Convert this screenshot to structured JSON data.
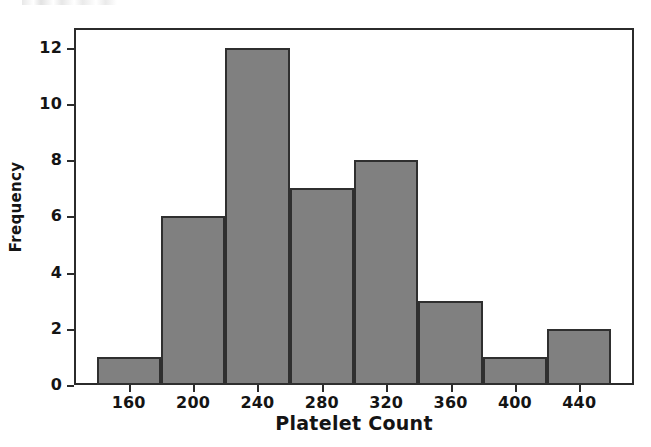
{
  "chart_data": {
    "type": "bar",
    "title": "",
    "xlabel": "Platelet Count",
    "ylabel": "Frequency",
    "categories": [
      "160",
      "200",
      "240",
      "280",
      "320",
      "360",
      "400",
      "440"
    ],
    "values": [
      1,
      6,
      12,
      7,
      8,
      3,
      1,
      2
    ],
    "bins": [
      {
        "label": "160",
        "left": 140,
        "right": 180,
        "value": 1
      },
      {
        "label": "200",
        "left": 180,
        "right": 220,
        "value": 6
      },
      {
        "label": "240",
        "left": 220,
        "right": 260,
        "value": 12
      },
      {
        "label": "280",
        "left": 260,
        "right": 300,
        "value": 7
      },
      {
        "label": "320",
        "left": 300,
        "right": 340,
        "value": 8
      },
      {
        "label": "360",
        "left": 340,
        "right": 380,
        "value": 3
      },
      {
        "label": "400",
        "left": 380,
        "right": 420,
        "value": 1
      },
      {
        "label": "440",
        "left": 420,
        "right": 460,
        "value": 2
      }
    ],
    "bin_width": 40,
    "total_count": 40,
    "xlim": [
      126,
      474
    ],
    "ylim": [
      0,
      12.7
    ],
    "xticks": [
      160,
      200,
      240,
      280,
      320,
      360,
      400,
      440
    ],
    "yticks": [
      0,
      2,
      4,
      6,
      8,
      10,
      12
    ],
    "ytick_labels": [
      "0",
      "2",
      "4",
      "6",
      "8",
      "10",
      "12"
    ],
    "grid": false,
    "legend": false,
    "legend_position": "none",
    "colors": {
      "bar_fill": "#808080",
      "bar_edge": "#2f2f2f",
      "axis": "#2b2b2b",
      "text": "#141414",
      "background": "#ffffff"
    }
  },
  "artifact": {
    "top_fragment": ""
  }
}
